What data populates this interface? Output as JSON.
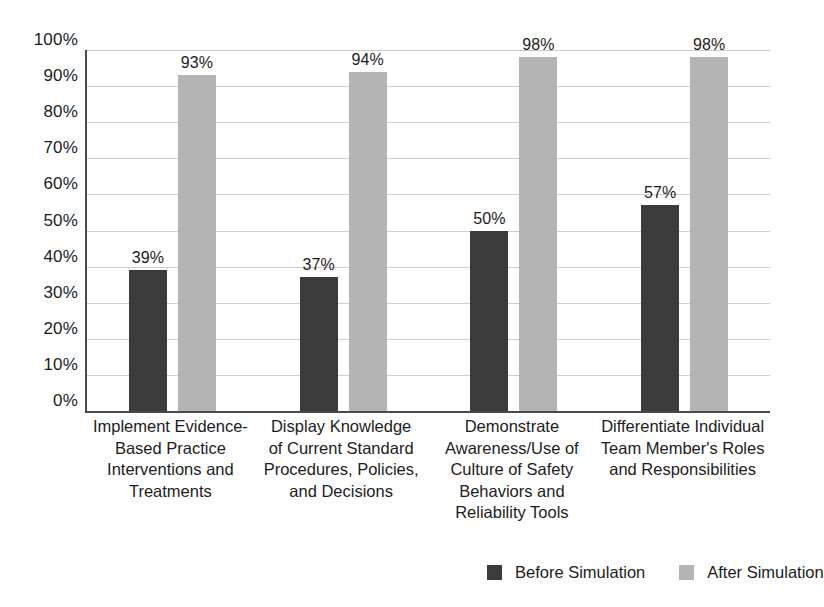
{
  "chart_data": {
    "type": "bar",
    "title": "",
    "subtitle": "",
    "xlabel": "",
    "ylabel": "",
    "ylim": [
      0,
      100
    ],
    "grid": true,
    "legend_position": "bottom-right",
    "categories": [
      "Implement Evidence-Based Practice Interventions and Treatments",
      "Display Knowledge of Current Standard Procedures, Policies, and Decisions",
      "Demonstrate Awareness/Use of Culture of Safety Behaviors and Reliability Tools",
      "Differentiate Individual Team Member's Roles and Responsibilities"
    ],
    "category_lines": [
      [
        "Implement Evidence-",
        "Based Practice",
        "Interventions and",
        "Treatments"
      ],
      [
        "Display Knowledge",
        "of Current Standard",
        "Procedures, Policies,",
        "and Decisions"
      ],
      [
        "Demonstrate",
        "Awareness/Use of",
        "Culture of Safety",
        "Behaviors and",
        "Reliability Tools"
      ],
      [
        "Differentiate Individual",
        "Team Member's Roles",
        "and Responsibilities"
      ]
    ],
    "series": [
      {
        "name": "Before Simulation",
        "color": "#3b3b3b",
        "values": [
          39,
          37,
          50,
          57
        ],
        "labels": [
          "39%",
          "37%",
          "50%",
          "57%"
        ]
      },
      {
        "name": "After Simulation",
        "color": "#b4b4b4",
        "values": [
          93,
          94,
          98,
          98
        ],
        "labels": [
          "93%",
          "94%",
          "98%",
          "98%"
        ]
      }
    ],
    "y_ticks": [
      0,
      10,
      20,
      30,
      40,
      50,
      60,
      70,
      80,
      90,
      100
    ],
    "y_tick_labels": [
      "0%",
      "10%",
      "20%",
      "30%",
      "40%",
      "50%",
      "60%",
      "70%",
      "80%",
      "90%",
      "100%"
    ]
  },
  "legend": {
    "items": [
      {
        "label": "Before Simulation",
        "color": "#3b3b3b"
      },
      {
        "label": "After Simulation",
        "color": "#b4b4b4"
      }
    ]
  },
  "colors": {
    "before": "#3b3b3b",
    "after": "#b4b4b4",
    "axis": "#4a4a4a",
    "gridline": "#cfcfcf",
    "text": "#1c1c1c",
    "background": "#ffffff"
  }
}
